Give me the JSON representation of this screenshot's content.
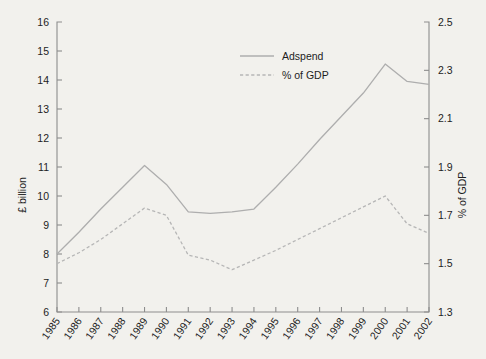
{
  "chart_data": {
    "type": "line",
    "title": "",
    "xlabel": "",
    "ylabel": "£ billion",
    "y2label": "% of GDP",
    "categories": [
      "1985",
      "1986",
      "1987",
      "1988",
      "1989",
      "1990",
      "1991",
      "1992",
      "1993",
      "1994",
      "1995",
      "1996",
      "1997",
      "1998",
      "1999",
      "2000",
      "2001",
      "2002"
    ],
    "ylim": [
      6,
      16
    ],
    "y2lim": [
      1.3,
      2.5
    ],
    "yticks": [
      6,
      7,
      8,
      9,
      10,
      11,
      12,
      13,
      14,
      15,
      16
    ],
    "y2ticks": [
      1.3,
      1.5,
      1.7,
      1.9,
      2.1,
      2.3,
      2.5
    ],
    "grid": false,
    "legend_position": "top-center",
    "series": [
      {
        "name": "Adspend",
        "axis": "left",
        "style": "solid",
        "color": "#aeaeae",
        "values": [
          8.0,
          8.75,
          9.55,
          10.3,
          11.05,
          10.4,
          9.45,
          9.4,
          9.45,
          9.55,
          10.3,
          11.1,
          11.95,
          12.75,
          13.55,
          14.55,
          13.95,
          13.85
        ]
      },
      {
        "name": "% of GDP",
        "axis": "right",
        "style": "dashed",
        "color": "#b6b6b6",
        "values": [
          1.5,
          1.545,
          1.6,
          1.665,
          1.73,
          1.7,
          1.535,
          1.515,
          1.475,
          1.515,
          1.555,
          1.6,
          1.645,
          1.69,
          1.735,
          1.78,
          1.665,
          1.625
        ]
      }
    ]
  },
  "axes": {
    "left_title": "£ billion",
    "right_title": "% of GDP",
    "left_ticks": [
      "6",
      "7",
      "8",
      "9",
      "10",
      "11",
      "12",
      "13",
      "14",
      "15",
      "16"
    ],
    "right_ticks": [
      "1.3",
      "1.5",
      "1.7",
      "1.9",
      "2.1",
      "2.3",
      "2.5"
    ],
    "x_ticks": [
      "1985",
      "1986",
      "1987",
      "1988",
      "1989",
      "1990",
      "1991",
      "1992",
      "1993",
      "1994",
      "1995",
      "1996",
      "1997",
      "1998",
      "1999",
      "2000",
      "2001",
      "2002"
    ]
  },
  "legend": {
    "items": [
      {
        "label": "Adspend",
        "style": "solid"
      },
      {
        "label": "% of GDP",
        "style": "dashed"
      }
    ]
  }
}
